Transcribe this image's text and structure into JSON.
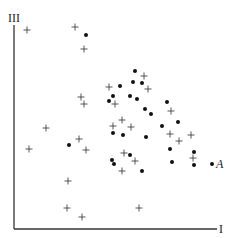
{
  "chart_data": {
    "type": "scatter",
    "title": "",
    "xlabel": "I",
    "ylabel": "III",
    "grid": false,
    "legend": null,
    "axes_px": {
      "origin": [
        14,
        229
      ],
      "x_end": 217,
      "y_top": 25
    },
    "series": [
      {
        "name": "plus",
        "marker": "+",
        "points_px": [
          [
            27,
            30
          ],
          [
            75,
            27
          ],
          [
            84,
            49
          ],
          [
            81,
            97
          ],
          [
            84,
            104
          ],
          [
            109,
            87
          ],
          [
            115,
            104
          ],
          [
            144,
            76
          ],
          [
            148,
            89
          ],
          [
            171,
            111
          ],
          [
            113,
            126
          ],
          [
            122,
            120
          ],
          [
            131,
            127
          ],
          [
            46,
            128
          ],
          [
            29,
            149
          ],
          [
            79,
            139
          ],
          [
            86,
            150
          ],
          [
            124,
            153
          ],
          [
            135,
            161
          ],
          [
            122,
            171
          ],
          [
            170,
            134
          ],
          [
            179,
            141
          ],
          [
            191,
            135
          ],
          [
            193,
            158
          ],
          [
            68,
            181
          ],
          [
            67,
            208
          ],
          [
            82,
            217
          ],
          [
            139,
            208
          ]
        ]
      },
      {
        "name": "dot",
        "marker": "•",
        "points_px": [
          [
            86,
            35
          ],
          [
            135,
            71
          ],
          [
            133,
            82
          ],
          [
            142,
            83
          ],
          [
            120,
            86
          ],
          [
            113,
            96
          ],
          [
            109,
            101
          ],
          [
            130,
            96
          ],
          [
            137,
            99
          ],
          [
            167,
            102
          ],
          [
            145,
            109
          ],
          [
            151,
            114
          ],
          [
            162,
            126
          ],
          [
            178,
            122
          ],
          [
            113,
            133
          ],
          [
            123,
            135
          ],
          [
            146,
            137
          ],
          [
            69,
            145
          ],
          [
            130,
            155
          ],
          [
            112,
            160
          ],
          [
            114,
            164
          ],
          [
            170,
            149
          ],
          [
            194,
            152
          ],
          [
            172,
            162
          ],
          [
            194,
            165
          ],
          [
            142,
            171
          ],
          [
            212,
            164
          ]
        ]
      }
    ],
    "annotations": [
      {
        "text": "A",
        "at_px": [
          218,
          159
        ],
        "refers_to": [
          212,
          164
        ]
      }
    ]
  },
  "labels": {
    "x_axis": "I",
    "y_axis": "III",
    "point_a": "A"
  }
}
